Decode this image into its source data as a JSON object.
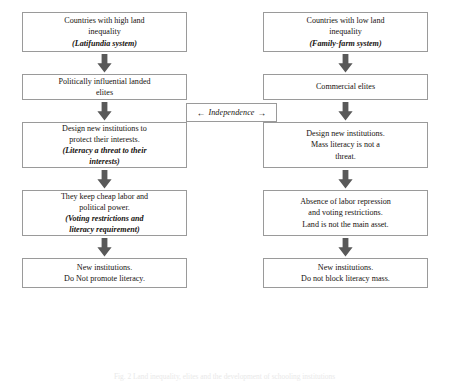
{
  "diagram": {
    "caption": "Fig. 2 Land inequality, elites and the development of schooling institutions",
    "colors": {
      "box_border": "#9a9a9a",
      "arrow_fill": "#595959",
      "text": "#16120f",
      "background": "#ffffff"
    },
    "center": {
      "left_arrow": "←",
      "label": "Independence",
      "right_arrow": "→"
    },
    "left_column": {
      "name": "high-land-inequality-flow",
      "nodes": [
        {
          "id": "left-1",
          "lines": [
            {
              "text": "Countries with high land",
              "italic": false
            },
            {
              "text": "inequality",
              "italic": false
            },
            {
              "text": "(Latifundia system)",
              "italic": true
            }
          ]
        },
        {
          "id": "left-2",
          "lines": [
            {
              "text": "Politically influential landed",
              "italic": false
            },
            {
              "text": "elites",
              "italic": false
            }
          ]
        },
        {
          "id": "left-3",
          "lines": [
            {
              "text": "Design new institutions to",
              "italic": false
            },
            {
              "text": "protect their interests.",
              "italic": false
            },
            {
              "text": "(Literacy a threat to their",
              "italic": true
            },
            {
              "text": "interests)",
              "italic": true
            }
          ]
        },
        {
          "id": "left-4",
          "lines": [
            {
              "text": "They keep cheap labor and",
              "italic": false
            },
            {
              "text": "political power.",
              "italic": false
            },
            {
              "text": "(Voting restrictions and",
              "italic": true
            },
            {
              "text": "literacy requirement)",
              "italic": true
            }
          ]
        },
        {
          "id": "left-5",
          "lines": [
            {
              "text": "New institutions.",
              "italic": false
            },
            {
              "text": "Do Not promote literacy.",
              "italic": false
            }
          ]
        }
      ]
    },
    "right_column": {
      "name": "low-land-inequality-flow",
      "nodes": [
        {
          "id": "right-1",
          "lines": [
            {
              "text": "Countries with low land",
              "italic": false
            },
            {
              "text": "inequality",
              "italic": false
            },
            {
              "text": "(Family-farm system)",
              "italic": true
            }
          ]
        },
        {
          "id": "right-2",
          "lines": [
            {
              "text": "Commercial elites",
              "italic": false
            }
          ]
        },
        {
          "id": "right-3",
          "lines": [
            {
              "text": "Design new institutions.",
              "italic": false
            },
            {
              "text": "Mass literacy is not a",
              "italic": false
            },
            {
              "text": "threat.",
              "italic": false
            }
          ]
        },
        {
          "id": "right-4",
          "lines": [
            {
              "text": "Absence of labor repression",
              "italic": false
            },
            {
              "text": "and voting restrictions.",
              "italic": false
            },
            {
              "text": "Land is not the main asset.",
              "italic": false
            }
          ]
        },
        {
          "id": "right-5",
          "lines": [
            {
              "text": "New institutions.",
              "italic": false
            },
            {
              "text": "Do not block literacy mass.",
              "italic": false
            }
          ]
        }
      ]
    },
    "arrow_icon_name": "down-block-arrow-icon"
  }
}
